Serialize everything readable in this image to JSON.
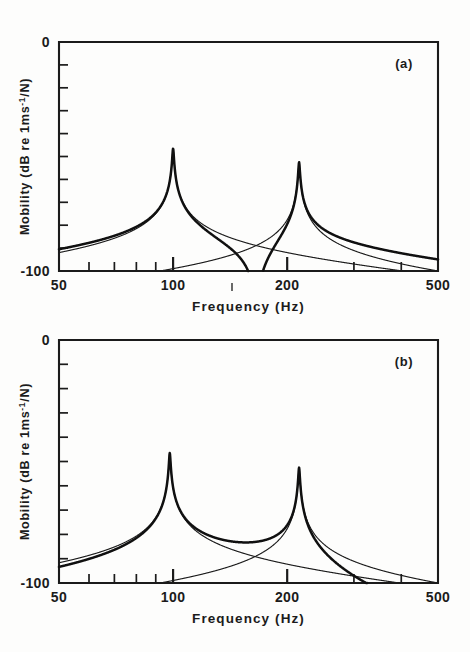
{
  "figure": {
    "title": "",
    "background": "#fdfdfc",
    "ink_color": "#1b1b1b"
  },
  "chart_data": [
    {
      "type": "line",
      "panel": "a",
      "panel_label": "(a)",
      "title": "",
      "xlabel": "Frequency  (Hz)",
      "ylabel": "Mobility (dB re 1ms-1/N)",
      "ylabel_parts": {
        "lead": "Mobility  (dB  re  1ms",
        "superscript": "-1",
        "tail": "/N)"
      },
      "xscale": "log",
      "xlim": [
        50,
        500
      ],
      "ylim": [
        -100,
        0
      ],
      "xticks": [
        50,
        60,
        70,
        80,
        90,
        100,
        200,
        300,
        400,
        500
      ],
      "xticklabels": [
        "50",
        "",
        "",
        "",
        "",
        "100",
        "200",
        "",
        "",
        "500"
      ],
      "yticks": [
        0,
        -10,
        -20,
        -30,
        -40,
        -50,
        -60,
        -70,
        -80,
        -90,
        -100
      ],
      "yticklabels": [
        "0",
        "",
        "",
        "",
        "",
        "",
        "",
        "",
        "",
        "",
        "-100"
      ],
      "grid": false,
      "legend": "none",
      "series": [
        {
          "name": "mode-1-contribution",
          "style": "thin",
          "model": "sdof",
          "f0": 100,
          "loss_factor": 0.008,
          "level_db": -46.5,
          "phase": 1
        },
        {
          "name": "mode-2-contribution",
          "style": "thin",
          "model": "sdof",
          "f0": 215,
          "loss_factor": 0.008,
          "level_db": -52.5,
          "phase": 1
        },
        {
          "name": "total-mobility-in-phase",
          "style": "thick",
          "model": "sum",
          "antiresonance_hz": 158,
          "antiresonance_db": -100
        }
      ],
      "annotations": [
        {
          "text": "(a)",
          "x_px": 404,
          "y_px": 68
        }
      ]
    },
    {
      "type": "line",
      "panel": "b",
      "panel_label": "(b)",
      "title": "",
      "xlabel": "Frequency  (Hz)",
      "ylabel": "Mobility (dB re 1ms-1/N)",
      "ylabel_parts": {
        "lead": "Mobility  (dB  re  1ms",
        "superscript": "-1",
        "tail": "/N)"
      },
      "xscale": "log",
      "xlim": [
        50,
        500
      ],
      "ylim": [
        -100,
        0
      ],
      "xticks": [
        50,
        60,
        70,
        80,
        90,
        100,
        200,
        300,
        400,
        500
      ],
      "xticklabels": [
        "50",
        "",
        "",
        "",
        "",
        "100",
        "200",
        "",
        "",
        "500"
      ],
      "yticks": [
        0,
        -10,
        -20,
        -30,
        -40,
        -50,
        -60,
        -70,
        -80,
        -90,
        -100
      ],
      "yticklabels": [
        "0",
        "",
        "",
        "",
        "",
        "",
        "",
        "",
        "",
        "",
        "-100"
      ],
      "grid": false,
      "legend": "none",
      "series": [
        {
          "name": "mode-1-contribution",
          "style": "thin",
          "model": "sdof",
          "f0": 98,
          "loss_factor": 0.008,
          "level_db": -46.5,
          "phase": 1
        },
        {
          "name": "mode-2-contribution",
          "style": "thin",
          "model": "sdof",
          "f0": 215,
          "loss_factor": 0.008,
          "level_db": -52.5,
          "phase": -1
        },
        {
          "name": "total-mobility-out-of-phase",
          "style": "thick",
          "model": "sum",
          "high_freq_rolloff_db_at_500": -88
        }
      ],
      "annotations": [
        {
          "text": "(b)",
          "x_px": 404,
          "y_px": 366
        }
      ]
    }
  ]
}
